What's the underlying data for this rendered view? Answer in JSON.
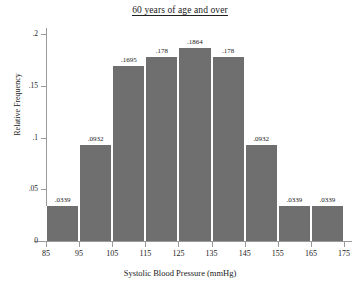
{
  "chart_data": {
    "type": "bar",
    "title": "60 years of age and over",
    "xlabel": "Systolic Blood Pressure (mmHg)",
    "ylabel": "Relative Frequency",
    "grid": false,
    "legend": "none",
    "xlim": [
      85,
      175
    ],
    "ylim": [
      0,
      0.2
    ],
    "bin_width": 10,
    "x_ticks": [
      "85",
      "95",
      "105",
      "115",
      "125",
      "135",
      "145",
      "155",
      "165",
      "175"
    ],
    "x_tick_values": [
      85,
      95,
      105,
      115,
      125,
      135,
      145,
      155,
      165,
      175
    ],
    "y_ticks": [
      "0",
      ".05",
      ".1",
      ".15",
      ".2"
    ],
    "y_tick_values": [
      0,
      0.05,
      0.1,
      0.15,
      0.2
    ],
    "bin_edges": [
      85,
      95,
      105,
      115,
      125,
      135,
      145,
      155,
      165,
      175
    ],
    "categories": [
      "85-95",
      "95-105",
      "105-115",
      "115-125",
      "125-135",
      "135-145",
      "145-155",
      "155-165",
      "165-175"
    ],
    "values": [
      0.0339,
      0.0932,
      0.1695,
      0.178,
      0.1864,
      0.178,
      0.0932,
      0.0339,
      0.0339
    ],
    "data_labels": [
      ".0339",
      ".0932",
      ".1695",
      ".178",
      ".1864",
      ".178",
      ".0932",
      ".0339",
      ".0339"
    ],
    "bar_color": "#6f6f6f",
    "bar_edge_color": "#ffffff",
    "axis_color": "#9a9a9a"
  }
}
